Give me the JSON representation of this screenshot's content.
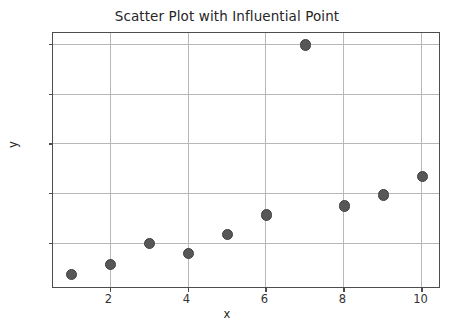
{
  "chart_data": {
    "type": "scatter",
    "title": "Scatter Plot with Influential Point",
    "xlabel": "x",
    "ylabel": "y",
    "x": [
      1,
      2,
      3,
      4,
      5,
      6,
      7,
      8,
      9,
      10
    ],
    "y": [
      1.9,
      2.9,
      5.0,
      4.0,
      5.9,
      7.9,
      25.0,
      8.8,
      9.9,
      11.8
    ],
    "series": [
      {
        "name": "data",
        "marker": "circle",
        "color": "#575757",
        "points": [
          {
            "x": 1,
            "y": 1.9
          },
          {
            "x": 2,
            "y": 2.9
          },
          {
            "x": 3,
            "y": 5.0
          },
          {
            "x": 4,
            "y": 4.0
          },
          {
            "x": 5,
            "y": 5.9
          },
          {
            "x": 6,
            "y": 7.9
          },
          {
            "x": 7,
            "y": 25.0
          },
          {
            "x": 8,
            "y": 8.8
          },
          {
            "x": 9,
            "y": 9.9
          },
          {
            "x": 10,
            "y": 11.8
          }
        ]
      }
    ],
    "xlim": [
      0.55,
      10.45
    ],
    "ylim": [
      0.55,
      26.1
    ],
    "xticks": [
      2,
      4,
      6,
      8,
      10
    ],
    "xtick_labels": [
      "2",
      "4",
      "6",
      "8",
      "10"
    ],
    "yticks": [
      5,
      10,
      15,
      20,
      25
    ],
    "ytick_labels": [
      "5",
      "10",
      "15",
      "20",
      "25"
    ],
    "grid": true,
    "grid_color": "#b8b8b8",
    "legend": null,
    "annotations": [],
    "marker_color": "#575757",
    "frame_color": "#4d4d4d",
    "background": "#ffffff"
  }
}
